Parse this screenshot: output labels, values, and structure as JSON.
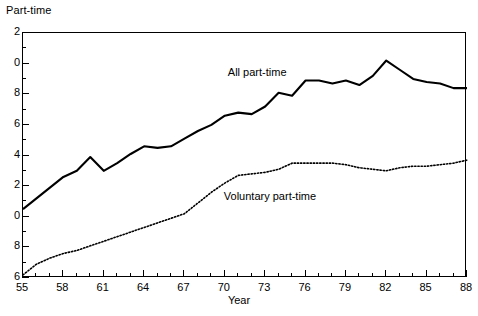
{
  "chart_data": {
    "type": "line",
    "title": "Part-time",
    "xlabel": "Year",
    "ylabel": "Part-time",
    "grid": false,
    "legend_position": "inline-annotations",
    "xlim": [
      55,
      88
    ],
    "ylim": [
      6,
      22
    ],
    "y_major_ticks": [
      6,
      8,
      10,
      12,
      14,
      16,
      18,
      20,
      22
    ],
    "y_major_tick_labels": [
      "6",
      "8",
      "0",
      "2",
      "4",
      "6",
      "8",
      "0",
      "2"
    ],
    "y_minor_ticks": [
      7,
      9,
      11,
      13,
      15,
      17,
      19,
      21
    ],
    "x_major_ticks": [
      55,
      58,
      61,
      64,
      67,
      70,
      73,
      76,
      79,
      82,
      85,
      88
    ],
    "x_major_tick_labels": [
      "55",
      "58",
      "61",
      "64",
      "67",
      "70",
      "73",
      "76",
      "79",
      "82",
      "85",
      "88"
    ],
    "x_minor_ticks": [
      56,
      57,
      59,
      60,
      62,
      63,
      65,
      66,
      68,
      69,
      71,
      72,
      74,
      75,
      77,
      78,
      80,
      81,
      83,
      84,
      86,
      87
    ],
    "x": [
      55,
      56,
      57,
      58,
      59,
      60,
      61,
      62,
      63,
      64,
      65,
      66,
      67,
      68,
      69,
      70,
      71,
      72,
      73,
      74,
      75,
      76,
      77,
      78,
      79,
      80,
      81,
      82,
      83,
      84,
      85,
      86,
      87,
      88
    ],
    "series": [
      {
        "name": "All part-time",
        "style": "solid",
        "color": "#000000",
        "label_x": 70.3,
        "label_y": 19.4,
        "values": [
          10.5,
          11.2,
          11.9,
          12.6,
          13.0,
          13.9,
          13.0,
          13.5,
          14.1,
          14.6,
          14.5,
          14.6,
          15.1,
          15.6,
          16.0,
          16.6,
          16.8,
          16.7,
          17.2,
          18.1,
          17.9,
          18.9,
          18.9,
          18.7,
          18.9,
          18.6,
          19.2,
          20.2,
          19.6,
          19.0,
          18.8,
          18.7,
          18.4,
          18.4
        ]
      },
      {
        "name": "Voluntary part-time",
        "style": "dotted",
        "color": "#000000",
        "label_x": 70.0,
        "label_y": 11.3,
        "values": [
          6.2,
          6.9,
          7.3,
          7.6,
          7.8,
          8.1,
          8.4,
          8.7,
          9.0,
          9.3,
          9.6,
          9.9,
          10.2,
          10.9,
          11.6,
          12.2,
          12.7,
          12.8,
          12.9,
          13.1,
          13.5,
          13.5,
          13.5,
          13.5,
          13.4,
          13.2,
          13.1,
          13.0,
          13.2,
          13.3,
          13.3,
          13.4,
          13.5,
          13.7
        ]
      }
    ]
  }
}
